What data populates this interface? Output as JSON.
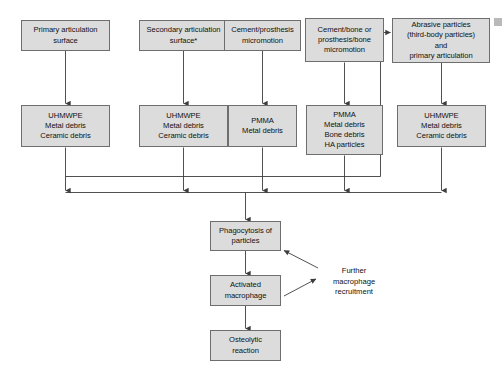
{
  "diagram": {
    "colors": {
      "node_fill": "#dcdcdc",
      "node_border": "#6e6e6e",
      "connector": "#3d3d3d",
      "text": "#111111",
      "background": "#ffffff"
    },
    "sources": [
      {
        "id": "source-primary-articulation",
        "label": "Primary articulation\nsurface"
      },
      {
        "id": "source-secondary-articulation",
        "label": "Secondary articulation\nsurface*"
      },
      {
        "id": "source-cement-prosthesis-micromotion",
        "label": "Cement/prosthesis\nmicromotion"
      },
      {
        "id": "source-cement-bone-micromotion",
        "label": "Cement/bone or\nprosthesis/bone\nmicromotion"
      },
      {
        "id": "source-abrasive-particles",
        "label": "Abrasive particles\n(third-body particles)\nand\nprimary articulation"
      }
    ],
    "debris": [
      {
        "id": "debris-column-1",
        "label": "UHMWPE\nMetal debris\nCeramic debris"
      },
      {
        "id": "debris-column-2",
        "label": "UHMWPE\nMetal debris\nCeramic debris"
      },
      {
        "id": "debris-column-3",
        "label": "PMMA\nMetal debris"
      },
      {
        "id": "debris-column-4",
        "label": "PMMA\nMetal debris\nBone debris\nHA particles"
      },
      {
        "id": "debris-column-5",
        "label": "UHMWPE\nMetal debris\nCeramic debris"
      }
    ],
    "response_chain": [
      {
        "id": "step-phagocytosis",
        "label": "Phagocytosis of\nparticles"
      },
      {
        "id": "step-activated-macrophage",
        "label": "Activated\nmacrophage"
      },
      {
        "id": "step-osteolytic-reaction",
        "label": "Osteolytic\nreaction"
      }
    ],
    "annotations": [
      {
        "id": "annotation-further-macrophage-recruitment",
        "label": "Further\nmacrophage\nrecruitment"
      }
    ]
  }
}
